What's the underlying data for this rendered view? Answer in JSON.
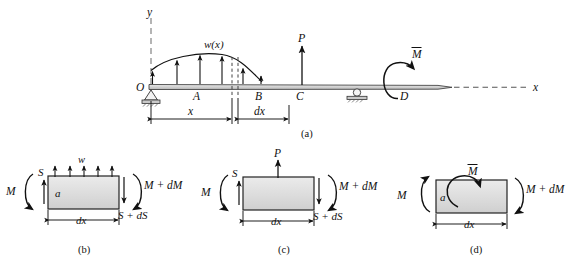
{
  "figure": {
    "type": "engineering-beam-diagram",
    "caption_a": "(a)",
    "caption_b": "(b)",
    "caption_c": "(c)",
    "caption_d": "(d)",
    "colors": {
      "line": "#111111",
      "beam_fill": "#d9d9d9",
      "element_fill": "#dedede",
      "dashed": "#777777",
      "background": "#ffffff"
    }
  },
  "panel_a": {
    "axis_y_label": "y",
    "axis_x_label": "x",
    "origin_label": "O",
    "distributed_load_label": "w(x)",
    "point_a_label": "A",
    "point_b_label": "B",
    "point_c_label": "C",
    "point_d_label": "D",
    "point_load_label": "P",
    "applied_moment_label": "M̅",
    "dim_x_label": "x",
    "dim_dx_label": "dx",
    "support_left": "pin-support",
    "support_right": "roller-support",
    "load_arrow_count": 6
  },
  "panel_b": {
    "load_label": "w",
    "shear_left_label": "S",
    "shear_right_label": "S + dS",
    "moment_left_label": "M",
    "moment_right_label": "M + dM",
    "section_label": "a",
    "dim_label": "dx",
    "load_arrow_count": 5
  },
  "panel_c": {
    "point_load_label": "P",
    "shear_left_label": "S",
    "shear_right_label": "S + dS",
    "moment_left_label": "M",
    "moment_right_label": "M + dM",
    "dim_label": "dx"
  },
  "panel_d": {
    "applied_moment_label": "M̅",
    "moment_left_label": "M",
    "moment_right_label": "M + dM",
    "section_label": "a",
    "dim_label": "dx"
  }
}
